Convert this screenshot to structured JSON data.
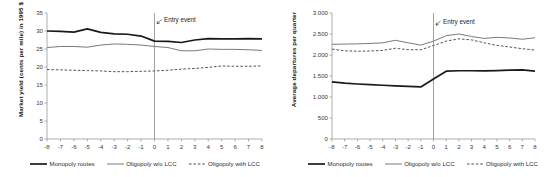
{
  "figure": {
    "panels": [
      {
        "id": "left-panel",
        "ylabel": "Market yield (cents per mile) in 1995 $",
        "annotation": "Entry event",
        "legend": [
          {
            "label": "Monopoly routes",
            "style": "solid-thick",
            "color": "#1a1a1a"
          },
          {
            "label": "Oligopoly w/o LCC",
            "style": "solid-thin",
            "color": "#7a7a7a"
          },
          {
            "label": "Oligopoly with LCC",
            "style": "dashed",
            "color": "#555555"
          }
        ]
      },
      {
        "id": "right-panel",
        "ylabel": "Average departures per quarter",
        "annotation": "Entry event",
        "legend": [
          {
            "label": "Monopoly routes",
            "style": "solid-thick",
            "color": "#1a1a1a"
          },
          {
            "label": "Oligopoly w/o LCC",
            "style": "solid-thin",
            "color": "#7a7a7a"
          },
          {
            "label": "Oligopoly with LCC",
            "style": "dashed",
            "color": "#555555"
          }
        ]
      }
    ]
  },
  "chart_data": [
    {
      "type": "line",
      "title": "",
      "xlabel": "",
      "ylabel": "Market yield (cents per mile) in 1995 $",
      "x": [
        -8,
        -7,
        -6,
        -5,
        -4,
        -3,
        -2,
        -1,
        0,
        1,
        2,
        3,
        4,
        5,
        6,
        7,
        8
      ],
      "xtick_labels": [
        "-8",
        "-7",
        "-6",
        "-5",
        "-4",
        "-3",
        "-2",
        "-1",
        "0",
        "1",
        "2",
        "3",
        "4",
        "5",
        "6",
        "7",
        "8"
      ],
      "ylim": [
        0,
        35
      ],
      "ytick_values": [
        0,
        5,
        10,
        15,
        20,
        25,
        30,
        35
      ],
      "ytick_labels": [
        "0",
        "5",
        "10",
        "15",
        "20",
        "25",
        "30",
        "35"
      ],
      "grid": false,
      "legend_position": "bottom",
      "annotations": [
        {
          "text": "Entry event",
          "x": 0,
          "y": 33.3,
          "marker": "arrow-to-vline"
        }
      ],
      "vline_x": 0,
      "series": [
        {
          "name": "Monopoly routes",
          "style": "solid-thick",
          "color": "#1a1a1a",
          "values": [
            30.0,
            29.9,
            29.7,
            30.6,
            29.6,
            29.2,
            29.1,
            28.6,
            27.2,
            27.1,
            26.8,
            27.5,
            27.9,
            27.8,
            27.8,
            27.9,
            27.8
          ]
        },
        {
          "name": "Oligopoly w/o LCC",
          "style": "solid-thin",
          "color": "#7a7a7a",
          "values": [
            25.4,
            25.7,
            25.7,
            25.5,
            26.1,
            26.4,
            26.3,
            26.1,
            25.7,
            25.4,
            24.5,
            24.5,
            25.0,
            24.9,
            24.9,
            24.8,
            24.6
          ]
        },
        {
          "name": "Oligopoly with LCC",
          "style": "dashed",
          "color": "#555555",
          "values": [
            19.3,
            19.2,
            19.1,
            19.0,
            18.9,
            18.7,
            18.7,
            18.8,
            18.9,
            19.1,
            19.4,
            19.6,
            19.9,
            20.3,
            20.2,
            20.2,
            20.3
          ]
        }
      ]
    },
    {
      "type": "line",
      "title": "",
      "xlabel": "",
      "ylabel": "Average departures per quarter",
      "x": [
        -8,
        -7,
        -6,
        -5,
        -4,
        -3,
        -2,
        -1,
        0,
        1,
        2,
        3,
        4,
        5,
        6,
        7,
        8
      ],
      "xtick_labels": [
        "-8",
        "-7",
        "-6",
        "-5",
        "-4",
        "-3",
        "-2",
        "-1",
        "0",
        "1",
        "2",
        "3",
        "4",
        "5",
        "6",
        "7",
        "8"
      ],
      "ylim": [
        0,
        3000
      ],
      "ytick_values": [
        0,
        500,
        1000,
        1500,
        2000,
        2500,
        3000
      ],
      "ytick_labels": [
        "0",
        "500",
        "1.000",
        "1.500",
        "2.000",
        "2.500",
        "3.000"
      ],
      "grid": false,
      "legend_position": "bottom",
      "annotations": [
        {
          "text": "Entry event",
          "x": 0,
          "y": 2820,
          "marker": "arrow-to-vline"
        }
      ],
      "vline_x": 0,
      "series": [
        {
          "name": "Monopoly routes",
          "style": "solid-thick",
          "color": "#1a1a1a",
          "values": [
            1360,
            1330,
            1310,
            1295,
            1280,
            1265,
            1255,
            1240,
            1430,
            1615,
            1625,
            1625,
            1620,
            1630,
            1640,
            1645,
            1615
          ]
        },
        {
          "name": "Oligopoly w/o LCC",
          "style": "solid-thin",
          "color": "#7a7a7a",
          "values": [
            2255,
            2260,
            2265,
            2275,
            2290,
            2350,
            2290,
            2235,
            2330,
            2460,
            2500,
            2440,
            2395,
            2420,
            2405,
            2375,
            2410
          ]
        },
        {
          "name": "Oligopoly with LCC",
          "style": "dashed",
          "color": "#555555",
          "values": [
            2140,
            2100,
            2090,
            2095,
            2110,
            2160,
            2125,
            2125,
            2225,
            2330,
            2385,
            2360,
            2290,
            2230,
            2190,
            2150,
            2115
          ]
        }
      ]
    }
  ]
}
